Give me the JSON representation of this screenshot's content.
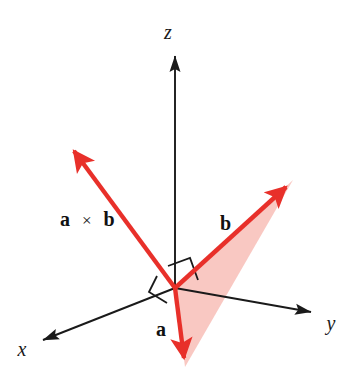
{
  "figure": {
    "width": 356,
    "height": 387,
    "background_color": "#ffffff"
  },
  "colors": {
    "axis": "#1a1a1a",
    "vector_red": "#e8302a",
    "plane_fill": "#f6a79d",
    "label_text": "#111111",
    "right_angle": "#1a1a1a"
  },
  "axes": [
    {
      "name": "z-axis",
      "label": "z",
      "style": "italic",
      "origin": [
        175,
        288
      ],
      "tip": [
        175,
        48
      ],
      "label_pos": [
        168,
        39
      ]
    },
    {
      "name": "y-axis",
      "label": "y",
      "style": "italic",
      "origin": [
        175,
        288
      ],
      "tip": [
        318,
        313
      ],
      "label_pos": [
        331,
        330
      ]
    },
    {
      "name": "x-axis",
      "label": "x",
      "style": "italic",
      "origin": [
        175,
        288
      ],
      "tip": [
        36,
        343
      ],
      "label_pos": [
        16,
        356
      ]
    }
  ],
  "vectors": [
    {
      "name": "cross-product-vector",
      "label_parts": {
        "left": "a",
        "operator": "×",
        "right": "b"
      },
      "label_text": "a × b",
      "origin": [
        175,
        288
      ],
      "tip": [
        68,
        143
      ],
      "label_pos": [
        60,
        226
      ],
      "color": "#e8302a"
    },
    {
      "name": "vector-b",
      "label_text": "b",
      "origin": [
        175,
        288
      ],
      "tip": [
        293,
        180
      ],
      "label_pos": [
        220,
        230
      ],
      "color": "#e8302a"
    },
    {
      "name": "vector-a",
      "label_text": "a",
      "origin": [
        175,
        288
      ],
      "tip": [
        185,
        367
      ],
      "label_pos": [
        156,
        336
      ],
      "color": "#e8302a"
    }
  ],
  "plane": {
    "name": "ab-plane",
    "points": [
      [
        175,
        288
      ],
      [
        293,
        180
      ],
      [
        185,
        367
      ]
    ],
    "fill": "#f6a79d",
    "opacity": 0.62
  },
  "right_angle_markers": [
    {
      "name": "right-angle-marker-b",
      "points": [
        [
          168,
          268
        ],
        [
          190,
          260
        ],
        [
          198,
          281
        ],
        [
          176,
          289
        ]
      ]
    },
    {
      "name": "right-angle-marker-a",
      "points": [
        [
          158,
          277
        ],
        [
          175,
          288
        ],
        [
          168,
          301
        ],
        [
          152,
          291
        ]
      ]
    }
  ]
}
